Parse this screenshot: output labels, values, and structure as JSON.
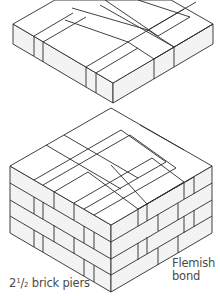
{
  "figure": {
    "type": "isometric brickwork diagram",
    "upper_course": {
      "description": "single course plan view of 2 1/2 brick pier"
    },
    "lower_pier": {
      "description": "four course pier in Flemish bond",
      "courses": 4
    }
  },
  "labels": {
    "piers_whole": "2",
    "piers_num": "1",
    "piers_den": "2",
    "piers_text": " brick piers",
    "bond_line1": "Flemish",
    "bond_line2": "bond"
  },
  "colors": {
    "line": "#2b2b2b",
    "face_fill": "#f1f1f1",
    "top_fill": "#ffffff",
    "text": "#4a4a4a"
  }
}
